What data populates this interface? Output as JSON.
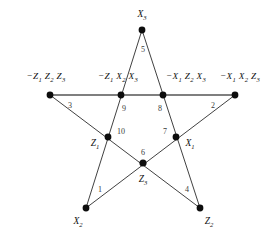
{
  "figure": {
    "canvas": {
      "width": 276,
      "height": 238
    },
    "colors": {
      "edge": "#2b2b2b",
      "edge_horizontal": "#555555",
      "node": "#0d0d0d",
      "label_text": "#111111",
      "number_text": "#3a3a3a",
      "background": "#ffffff"
    },
    "outer_points": [
      {
        "id": "top",
        "label_html": "X<sub>3</sub>",
        "label_plain": "X3",
        "x": 142,
        "y": 30,
        "label_x": 142,
        "label_y": 16
      },
      {
        "id": "left",
        "label_html": "&minus;Z<sub>1</sub> Z<sub>2</sub> Z<sub>3</sub>",
        "label_plain": "-Z1 Z2 Z3",
        "x": 50,
        "y": 95,
        "label_x": 46,
        "label_y": 78
      },
      {
        "id": "right",
        "label_html": "&minus;X<sub>1</sub> X<sub>2</sub> Z<sub>3</sub>",
        "label_plain": "-X1 X2 Z3",
        "x": 235,
        "y": 95,
        "label_x": 240,
        "label_y": 78
      },
      {
        "id": "bottom-left",
        "label_html": "X<sub>2</sub>",
        "label_plain": "X2",
        "x": 86,
        "y": 208,
        "label_x": 78,
        "label_y": 223
      },
      {
        "id": "bottom-right",
        "label_html": "Z<sub>2</sub>",
        "label_plain": "Z2",
        "x": 200,
        "y": 208,
        "label_x": 209,
        "label_y": 223
      }
    ],
    "inner_points": [
      {
        "id": "node-9",
        "number": "9",
        "label_html": "&minus;Z<sub>1</sub> X<sub>2</sub> X<sub>3</sub>",
        "label_plain": "-Z1 X2 X3",
        "x": 121,
        "y": 95,
        "label_x": 118,
        "label_y": 78,
        "num_x": 124,
        "num_y": 108
      },
      {
        "id": "node-8",
        "number": "8",
        "label_html": "&minus;X<sub>1</sub> Z<sub>2</sub> X<sub>3</sub>",
        "label_plain": "-X1 Z2 X3",
        "x": 163,
        "y": 95,
        "label_x": 186,
        "label_y": 78,
        "num_x": 160,
        "num_y": 108
      },
      {
        "id": "node-10",
        "number": "10",
        "label_html": "Z<sub>1</sub>",
        "label_plain": "Z1",
        "x": 108,
        "y": 137,
        "label_x": 95,
        "label_y": 145,
        "num_x": 121,
        "num_y": 131
      },
      {
        "id": "node-7",
        "number": "7",
        "label_html": "X<sub>1</sub>",
        "label_plain": "X1",
        "x": 176,
        "y": 137,
        "label_x": 190,
        "label_y": 145,
        "num_x": 165,
        "num_y": 131
      },
      {
        "id": "node-6",
        "number": "6",
        "label_html": "Z<sub>3</sub>",
        "label_plain": "Z3",
        "x": 143,
        "y": 163,
        "label_x": 143,
        "label_y": 181,
        "num_x": 143,
        "num_y": 152
      }
    ],
    "edge_numbers": [
      {
        "id": "edge-1",
        "number": "1",
        "x": 100,
        "y": 189
      },
      {
        "id": "edge-2",
        "number": "2",
        "x": 213,
        "y": 105
      },
      {
        "id": "edge-3",
        "number": "3",
        "x": 70,
        "y": 105
      },
      {
        "id": "edge-4",
        "number": "4",
        "x": 187,
        "y": 189
      },
      {
        "id": "edge-5",
        "number": "5",
        "x": 143,
        "y": 49
      }
    ],
    "edges": [
      {
        "id": "edge-top-to-bottom-right",
        "from": "top",
        "to": "bottom-right",
        "horizontal": false
      },
      {
        "id": "edge-top-to-bottom-left",
        "from": "top",
        "to": "bottom-left",
        "horizontal": false
      },
      {
        "id": "edge-left-to-right",
        "from": "left",
        "to": "right",
        "horizontal": true
      },
      {
        "id": "edge-left-to-bottom-right",
        "from": "left",
        "to": "bottom-right",
        "horizontal": false
      },
      {
        "id": "edge-right-to-bottom-left",
        "from": "right",
        "to": "bottom-left",
        "horizontal": false
      }
    ],
    "node_radius": {
      "outer": 3.4,
      "inner": 3.4,
      "center": 3.6
    }
  }
}
